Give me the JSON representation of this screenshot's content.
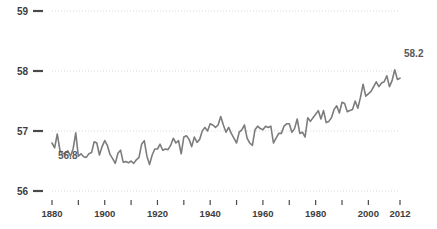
{
  "chart_data": {
    "type": "line",
    "title": "",
    "subtitle": "",
    "xlabel": "",
    "ylabel": "",
    "xlim": [
      1880,
      2012
    ],
    "ylim": [
      56,
      59
    ],
    "grid": true,
    "legend": null,
    "y_ticks": [
      "59",
      "58",
      "57",
      "56"
    ],
    "y_tick_values": [
      59,
      58,
      57,
      56
    ],
    "x_ticks": [
      "1880",
      "1900",
      "1920",
      "1940",
      "1960",
      "1980",
      "2000",
      "2012"
    ],
    "x_tick_values": [
      1880,
      1900,
      1920,
      1940,
      1960,
      1980,
      2000,
      2012
    ],
    "x_minor_tick_values": [
      1880,
      1890,
      1900,
      1910,
      1920,
      1930,
      1940,
      1950,
      1960,
      1970,
      1980,
      1990,
      2000,
      2012
    ],
    "annotations": [
      {
        "label": "56.8",
        "x": 1880,
        "y": 56.8,
        "position": "below-left"
      },
      {
        "label": "58.2",
        "x": 2012,
        "y": 58.2,
        "position": "right"
      }
    ],
    "series": [
      {
        "name": "Global average temperature",
        "color": "#7c7c7c",
        "x": [
          1880,
          1881,
          1882,
          1883,
          1884,
          1885,
          1886,
          1887,
          1888,
          1889,
          1890,
          1891,
          1892,
          1893,
          1894,
          1895,
          1896,
          1897,
          1898,
          1899,
          1900,
          1901,
          1902,
          1903,
          1904,
          1905,
          1906,
          1907,
          1908,
          1909,
          1910,
          1911,
          1912,
          1913,
          1914,
          1915,
          1916,
          1917,
          1918,
          1919,
          1920,
          1921,
          1922,
          1923,
          1924,
          1925,
          1926,
          1927,
          1928,
          1929,
          1930,
          1931,
          1932,
          1933,
          1934,
          1935,
          1936,
          1937,
          1938,
          1939,
          1940,
          1941,
          1942,
          1943,
          1944,
          1945,
          1946,
          1947,
          1948,
          1949,
          1950,
          1951,
          1952,
          1953,
          1954,
          1955,
          1956,
          1957,
          1958,
          1959,
          1960,
          1961,
          1962,
          1963,
          1964,
          1965,
          1966,
          1967,
          1968,
          1969,
          1970,
          1971,
          1972,
          1973,
          1974,
          1975,
          1976,
          1977,
          1978,
          1979,
          1980,
          1981,
          1982,
          1983,
          1984,
          1985,
          1986,
          1987,
          1988,
          1989,
          1990,
          1991,
          1992,
          1993,
          1994,
          1995,
          1996,
          1997,
          1998,
          1999,
          2000,
          2001,
          2002,
          2003,
          2004,
          2005,
          2006,
          2007,
          2008,
          2009,
          2010,
          2011,
          2012
        ],
        "values": [
          56.8,
          56.72,
          56.95,
          56.68,
          56.62,
          56.63,
          56.67,
          56.58,
          56.7,
          56.97,
          56.58,
          56.62,
          56.57,
          56.56,
          56.62,
          56.64,
          56.82,
          56.8,
          56.6,
          56.74,
          56.84,
          56.76,
          56.61,
          56.54,
          56.46,
          56.63,
          56.68,
          56.48,
          56.49,
          56.47,
          56.5,
          56.46,
          56.52,
          56.56,
          56.78,
          56.84,
          56.58,
          56.44,
          56.6,
          56.7,
          56.7,
          56.78,
          56.68,
          56.7,
          56.69,
          56.76,
          56.88,
          56.8,
          56.84,
          56.62,
          56.9,
          56.92,
          56.86,
          56.74,
          56.9,
          56.81,
          56.86,
          57.0,
          57.06,
          57.0,
          57.12,
          57.1,
          57.06,
          57.1,
          57.24,
          57.1,
          56.98,
          57.06,
          56.96,
          56.88,
          56.8,
          56.98,
          57.02,
          57.1,
          56.88,
          56.8,
          56.76,
          57.02,
          57.08,
          57.04,
          57.02,
          57.08,
          57.06,
          57.08,
          56.8,
          56.88,
          56.96,
          56.96,
          57.08,
          57.12,
          57.12,
          56.98,
          57.04,
          57.2,
          56.96,
          56.98,
          56.9,
          57.22,
          57.16,
          57.22,
          57.28,
          57.34,
          57.2,
          57.34,
          57.14,
          57.16,
          57.22,
          57.36,
          57.42,
          57.3,
          57.48,
          57.46,
          57.32,
          57.34,
          57.36,
          57.5,
          57.38,
          57.56,
          57.78,
          57.58,
          57.62,
          57.66,
          57.74,
          57.82,
          57.74,
          57.8,
          57.82,
          57.92,
          57.74,
          57.84,
          58.02,
          57.86,
          57.88
        ]
      }
    ]
  }
}
